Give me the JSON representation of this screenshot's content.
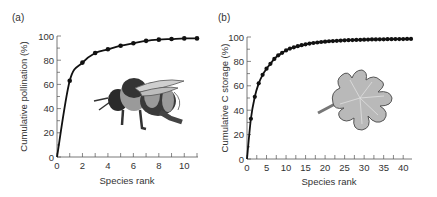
{
  "chart_data": [
    {
      "type": "line",
      "panel_label": "(a)",
      "title": "",
      "xlabel": "Species rank",
      "ylabel": "Cumulative pollination (%)",
      "xlim": [
        0,
        11
      ],
      "ylim": [
        0,
        100
      ],
      "xticks": [
        0,
        2,
        4,
        6,
        8,
        10
      ],
      "yticks": [
        0,
        20,
        40,
        60,
        80,
        100
      ],
      "grid": false,
      "legend": null,
      "illustration": "bumblebee",
      "x": [
        0,
        1,
        2,
        3,
        4,
        5,
        6,
        7,
        8,
        9,
        10,
        11
      ],
      "values": [
        0,
        63,
        78,
        86,
        89,
        92,
        94,
        96,
        97,
        97.5,
        98,
        98
      ]
    },
    {
      "type": "line",
      "panel_label": "(b)",
      "title": "",
      "xlabel": "Species rank",
      "ylabel": "Cumulative C storage (%)",
      "xlim": [
        0,
        42
      ],
      "ylim": [
        0,
        100
      ],
      "xticks": [
        0,
        5,
        10,
        15,
        20,
        25,
        30,
        35,
        40
      ],
      "yticks": [
        0,
        20,
        40,
        60,
        80,
        100
      ],
      "grid": false,
      "legend": null,
      "illustration": "leaf",
      "x": [
        0,
        1,
        2,
        3,
        4,
        5,
        6,
        7,
        8,
        9,
        10,
        11,
        12,
        13,
        14,
        15,
        16,
        17,
        18,
        19,
        20,
        21,
        22,
        23,
        24,
        25,
        26,
        27,
        28,
        29,
        30,
        31,
        32,
        33,
        34,
        35,
        36,
        37,
        38,
        39,
        40,
        41,
        42
      ],
      "values": [
        0,
        33,
        51,
        62,
        69,
        74,
        78,
        82,
        85,
        87,
        89,
        90.5,
        91.5,
        92.5,
        93.3,
        94,
        94.6,
        95.1,
        95.5,
        95.9,
        96.2,
        96.5,
        96.7,
        96.9,
        97.1,
        97.3,
        97.4,
        97.5,
        97.6,
        97.7,
        97.8,
        97.9,
        98,
        98,
        98.1,
        98.1,
        98.2,
        98.2,
        98.3,
        98.3,
        98.3,
        98.4,
        98.4
      ]
    }
  ]
}
